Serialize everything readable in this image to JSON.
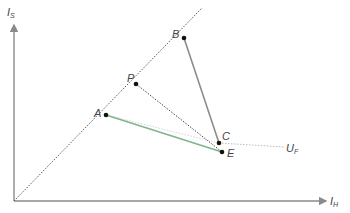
{
  "diagram": {
    "axes": {
      "y_label": "I",
      "y_sub": "S",
      "x_label": "I",
      "x_sub": "H",
      "axis_color": "#8a8a8a"
    },
    "points": [
      {
        "id": "A",
        "label": "A"
      },
      {
        "id": "P",
        "label": "P"
      },
      {
        "id": "B",
        "label": "B"
      },
      {
        "id": "C",
        "label": "C"
      },
      {
        "id": "E",
        "label": "E"
      }
    ],
    "annotations": {
      "uf_label": "U",
      "uf_sub": "F"
    },
    "colors": {
      "green_segment": "#7fb58a",
      "grey_segment": "#8c8c8c",
      "dotted": "#555555",
      "light_dotted": "#bbbbbb",
      "point": "#111111"
    }
  }
}
